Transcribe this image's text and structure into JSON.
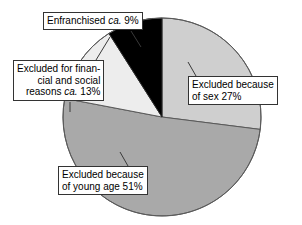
{
  "chart_data": {
    "type": "pie",
    "title": "",
    "subtitle": "",
    "xlabel": "",
    "ylabel": "",
    "legend_position": "callout-labels",
    "grid": false,
    "total_percent": 100,
    "start_angle_deg": 0,
    "direction": "clockwise",
    "categories": [
      "Excluded because of sex",
      "Excluded because of young age",
      "Excluded for financial and social reasons",
      "Enfranchised"
    ],
    "values": [
      27,
      51,
      13,
      9
    ],
    "slices": [
      {
        "name": "excluded-sex",
        "label_line1": "Excluded because",
        "label_line2": "of sex 27%",
        "value": 27,
        "color": "#cfcfcf",
        "approx": false
      },
      {
        "name": "excluded-young-age",
        "label_line1": "Excluded because",
        "label_line2": "of young age 51%",
        "value": 51,
        "color": "#a9a9a9",
        "approx": false
      },
      {
        "name": "excluded-financial-social",
        "label_line1": "Excluded for finan-",
        "label_line2": "cial and social",
        "label_line3_pre": "reasons ",
        "label_line3_it": "ca.",
        "label_line3_post": " 13%",
        "value": 13,
        "color": "#ededed",
        "approx": true
      },
      {
        "name": "enfranchised",
        "label_pre": "Enfranchised ",
        "label_it": "ca.",
        "label_post": " 9%",
        "value": 9,
        "color": "#000000",
        "approx": true
      }
    ]
  },
  "labels": {
    "enfranchised": {
      "pre": "Enfranchised ",
      "italic": "ca.",
      "post": " 9%"
    },
    "financial": {
      "line1": "Excluded for finan-",
      "line2": "cial and social",
      "line3_pre": "reasons ",
      "line3_italic": "ca.",
      "line3_post": " 13%"
    },
    "sex": {
      "line1": "Excluded because",
      "line2": "of sex 27%"
    },
    "young_age": {
      "line1": "Excluded because",
      "line2": "of young age 51%"
    }
  },
  "colors": {
    "slice_sex": "#cfcfcf",
    "slice_young_age": "#a9a9a9",
    "slice_financial": "#ededed",
    "slice_enfranchised": "#000000",
    "outline": "#4a4a4a",
    "background": "#ffffff",
    "box_border": "#333333",
    "text": "#000000"
  },
  "geometry": {
    "center_x": 162,
    "center_y": 117,
    "radius": 99
  }
}
